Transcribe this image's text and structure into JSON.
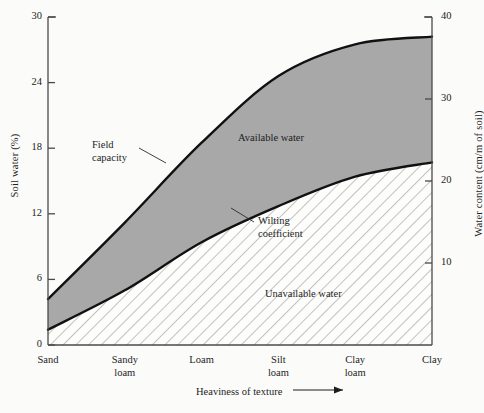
{
  "chart_data": {
    "type": "area",
    "title": "",
    "xlabel": "Heaviness of texture",
    "ylabel": "Soil water (%)",
    "ylabel_right": "Water content (cm/m of soil)",
    "categories": [
      "Sand",
      "Sandy\nloam",
      "Loam",
      "Silt\nloam",
      "Clay\nloam",
      "Clay"
    ],
    "x": [
      0,
      1,
      2,
      3,
      4,
      5
    ],
    "ylim": [
      0,
      30
    ],
    "yticks": [
      0,
      6,
      12,
      18,
      24,
      30
    ],
    "ylim_right": [
      0,
      40
    ],
    "yticks_right": [
      10,
      20,
      30,
      40
    ],
    "grid": false,
    "legend_position": "inline-annotations",
    "series": [
      {
        "name": "Field capacity",
        "values": [
          4.2,
          11.2,
          18.5,
          24.6,
          27.5,
          28.2
        ]
      },
      {
        "name": "Wilting coefficient",
        "values": [
          1.4,
          5.0,
          9.4,
          12.7,
          15.4,
          16.7
        ]
      }
    ],
    "regions": [
      {
        "name": "Available water",
        "between": [
          "Wilting coefficient",
          "Field capacity"
        ],
        "fill": "#a8a8a8"
      },
      {
        "name": "Unavailable water",
        "between": [
          "baseline",
          "Wilting coefficient"
        ],
        "fill": "hatched"
      }
    ],
    "annotations": [
      {
        "name": "Field capacity",
        "text": "Field\ncapacity"
      },
      {
        "name": "Wilting coefficient",
        "text": "Wilting\ncoefficient"
      },
      {
        "name": "Available water",
        "text": "Available water"
      },
      {
        "name": "Unavailable water",
        "text": "Unavailable water"
      }
    ],
    "colors": {
      "available_water_fill": "#a8a8a8",
      "unavailable_water_hatch": "#b0b0b0",
      "curve": "#111111",
      "axis": "#4a4a4a",
      "background": "#fbfbf9"
    }
  },
  "axes": {
    "left": {
      "title": "Soil water (%)",
      "ticks": [
        "0",
        "6",
        "12",
        "18",
        "24",
        "30"
      ]
    },
    "right": {
      "title": "Water content (cm/m of soil)",
      "ticks": [
        "10",
        "20",
        "30",
        "40"
      ]
    },
    "bottom": {
      "title": "Heaviness of texture",
      "arrow": "⟶",
      "categories": [
        "Sand",
        "Sandy\nloam",
        "Loam",
        "Silt\nloam",
        "Clay\nloam",
        "Clay"
      ]
    }
  },
  "labels": {
    "field_capacity": "Field\ncapacity",
    "wilting_coefficient": "Wilting\ncoefficient",
    "available_water": "Available water",
    "unavailable_water": "Unavailable water"
  }
}
